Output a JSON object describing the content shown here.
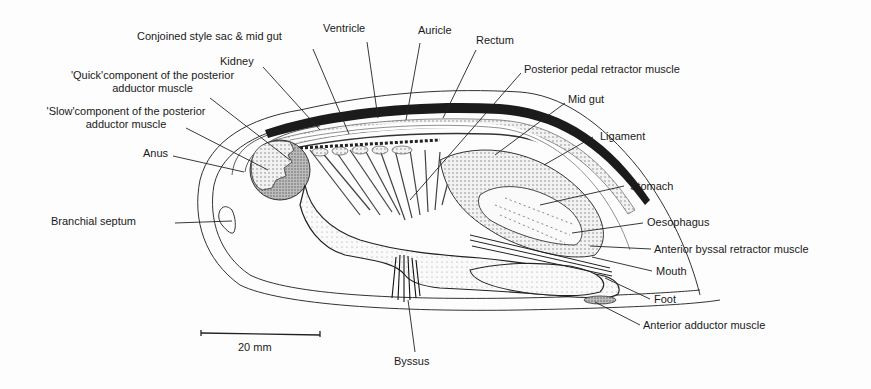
{
  "figure": {
    "scale_bar": {
      "label": "20 mm"
    },
    "labels": {
      "conjoined": "Conjoined style sac & mid gut",
      "ventricle": "Ventricle",
      "auricle": "Auricle",
      "rectum": "Rectum",
      "kidney": "Kidney",
      "quick": "'Quick'component of the posterior adductor muscle",
      "slow": "'Slow'component of the posterior adductor muscle",
      "posterior_pedal": "Posterior pedal retractor muscle",
      "mid_gut": "Mid gut",
      "ligament": "Ligament",
      "anus": "Anus",
      "stomach": "Stomach",
      "oesophagus": "Oesophagus",
      "branchial_septum": "Branchial septum",
      "anterior_byssal": "Anterior byssal retractor muscle",
      "mouth": "Mouth",
      "foot": "Foot",
      "anterior_adductor": "Anterior adductor muscle",
      "byssus": "Byssus"
    }
  }
}
